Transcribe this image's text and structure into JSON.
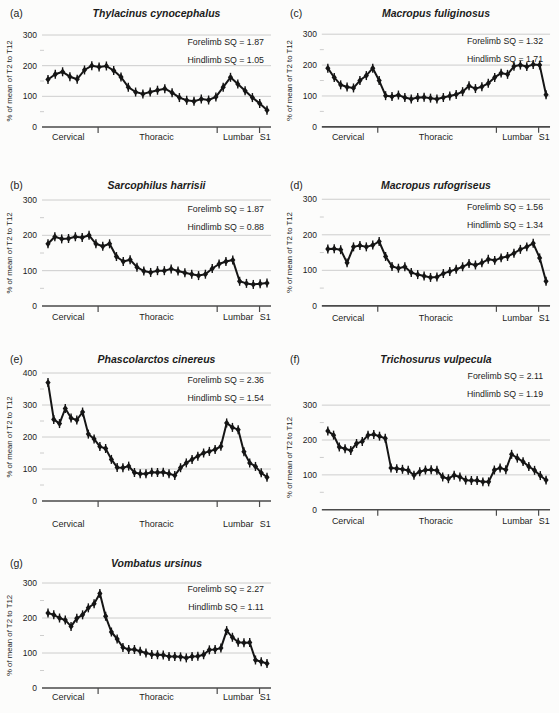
{
  "figure": {
    "ylabel": "% of mean of T2 to T12",
    "x_regions": [
      "Cervical",
      "Thoracic",
      "Lumbar",
      "S1"
    ],
    "region_tick_fractions": [
      0.245,
      0.765,
      0.95
    ],
    "grid": true,
    "legend": "none",
    "colors": {
      "background": "#fcfcfb",
      "line": "#151515",
      "grid": "#c2c2c2",
      "axis": "#4a4a4a",
      "text": "#1c1c1c"
    }
  },
  "chart_data": [
    {
      "id": "a",
      "type": "line",
      "panel_letter": "(a)",
      "title": "Thylacinus cynocephalus",
      "annotations": [
        "Forelimb SQ = 1.87",
        "Hindlimb SQ = 1.05"
      ],
      "ylabel": "% of mean of T2 to T12",
      "x_regions": [
        "Cervical",
        "Thoracic",
        "Lumbar",
        "S1"
      ],
      "ylim": [
        0,
        300
      ],
      "yticks": [
        0,
        100,
        200,
        300
      ],
      "values": [
        155,
        172,
        180,
        164,
        156,
        186,
        200,
        196,
        199,
        184,
        163,
        130,
        114,
        108,
        114,
        120,
        125,
        112,
        96,
        87,
        84,
        91,
        88,
        98,
        130,
        162,
        140,
        118,
        96,
        77,
        55
      ]
    },
    {
      "id": "b",
      "type": "line",
      "panel_letter": "(b)",
      "title": "Sarcophilus harrisii",
      "annotations": [
        "Forelimb SQ = 1.87",
        "Hindlimb SQ = 0.88"
      ],
      "ylabel": "% of mean of T2 to T12",
      "x_regions": [
        "Cervical",
        "Thoracic",
        "Lumbar",
        "S1"
      ],
      "ylim": [
        0,
        300
      ],
      "yticks": [
        0,
        100,
        200,
        300
      ],
      "values": [
        176,
        196,
        190,
        191,
        196,
        194,
        200,
        176,
        169,
        176,
        140,
        126,
        131,
        110,
        99,
        95,
        100,
        100,
        105,
        99,
        94,
        90,
        86,
        90,
        106,
        119,
        126,
        130,
        70,
        64,
        61,
        63,
        65
      ]
    },
    {
      "id": "c",
      "type": "line",
      "panel_letter": "(c)",
      "title": "Macropus fuliginosus",
      "annotations": [
        "Forelimb SQ = 1.32",
        "Hindlimb SQ = 1.71"
      ],
      "ylabel": "% of mean of T2 to T12",
      "x_regions": [
        "Cervical",
        "Thoracic",
        "Lumbar",
        "S1"
      ],
      "ylim": [
        0,
        300
      ],
      "yticks": [
        0,
        100,
        200,
        300
      ],
      "values": [
        190,
        160,
        136,
        129,
        126,
        150,
        166,
        190,
        150,
        101,
        98,
        103,
        95,
        90,
        95,
        96,
        93,
        90,
        95,
        100,
        105,
        114,
        133,
        124,
        130,
        141,
        160,
        174,
        170,
        196,
        200,
        195,
        202,
        200,
        104
      ]
    },
    {
      "id": "d",
      "type": "line",
      "panel_letter": "(d)",
      "title": "Macropus rufogriseus",
      "annotations": [
        "Forelimb SQ = 1.56",
        "Hindlimb SQ = 1.34"
      ],
      "ylabel": "% of mean of T2 to T12",
      "x_regions": [
        "Cervical",
        "Thoracic",
        "Lumbar",
        "S1"
      ],
      "ylim": [
        0,
        300
      ],
      "yticks": [
        0,
        100,
        200,
        300
      ],
      "values": [
        160,
        161,
        158,
        121,
        166,
        170,
        166,
        171,
        181,
        139,
        111,
        106,
        110,
        94,
        88,
        84,
        80,
        81,
        91,
        97,
        103,
        110,
        119,
        115,
        121,
        131,
        128,
        135,
        139,
        148,
        159,
        166,
        176,
        135,
        69
      ]
    },
    {
      "id": "e",
      "type": "line",
      "panel_letter": "(e)",
      "title": "Phascolarctos cinereus",
      "annotations": [
        "Forelimb SQ = 2.36",
        "Hindlimb SQ = 1.54"
      ],
      "ylabel": "% of mean of T2 to T12",
      "x_regions": [
        "Cervical",
        "Thoracic",
        "Lumbar",
        "S1"
      ],
      "ylim": [
        0,
        400
      ],
      "yticks": [
        0,
        100,
        200,
        300,
        400
      ],
      "values": [
        370,
        255,
        242,
        289,
        259,
        253,
        278,
        209,
        194,
        170,
        164,
        130,
        105,
        104,
        109,
        89,
        85,
        85,
        90,
        89,
        90,
        85,
        80,
        104,
        119,
        130,
        140,
        150,
        155,
        161,
        171,
        244,
        230,
        223,
        154,
        119,
        108,
        88,
        74
      ]
    },
    {
      "id": "f",
      "type": "line",
      "panel_letter": "(f)",
      "title": "Trichosurus vulpecula",
      "annotations": [
        "Forelimb SQ = 2.11",
        "Hindlimb SQ = 1.19"
      ],
      "ylabel": "% of mean of T2 to T12",
      "x_regions": [
        "Cervical",
        "Thoracic",
        "Lumbar",
        "S1"
      ],
      "ylim": [
        0,
        300
      ],
      "yticks": [
        0,
        100,
        200,
        300
      ],
      "values": [
        226,
        214,
        180,
        175,
        170,
        190,
        196,
        214,
        216,
        211,
        205,
        120,
        118,
        116,
        113,
        99,
        109,
        114,
        115,
        113,
        94,
        89,
        99,
        94,
        85,
        84,
        84,
        80,
        80,
        114,
        120,
        115,
        159,
        148,
        138,
        124,
        113,
        98,
        85
      ]
    },
    {
      "id": "g",
      "type": "line",
      "panel_letter": "(g)",
      "title": "Vombatus ursinus",
      "annotations": [
        "Forelimb SQ = 2.27",
        "Hindlimb SQ = 1.11"
      ],
      "ylabel": "% of mean of T2 to T12",
      "x_regions": [
        "Cervical",
        "Thoracic",
        "Lumbar",
        "S1"
      ],
      "ylim": [
        0,
        300
      ],
      "yticks": [
        0,
        100,
        200,
        300
      ],
      "values": [
        214,
        209,
        200,
        194,
        176,
        199,
        209,
        229,
        241,
        270,
        205,
        160,
        140,
        116,
        110,
        110,
        105,
        100,
        96,
        95,
        94,
        90,
        90,
        89,
        86,
        90,
        91,
        95,
        109,
        110,
        114,
        164,
        145,
        131,
        129,
        130,
        80,
        75,
        70
      ]
    }
  ]
}
